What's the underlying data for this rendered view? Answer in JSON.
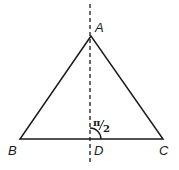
{
  "diagram": {
    "type": "isosceles-triangle-with-altitude",
    "points": {
      "A": {
        "label": "A",
        "x": 91,
        "y": 36
      },
      "B": {
        "label": "B",
        "x": 20,
        "y": 139
      },
      "C": {
        "label": "C",
        "x": 163,
        "y": 139
      },
      "D": {
        "label": "D",
        "x": 90,
        "y": 139
      }
    },
    "angle_label": {
      "num": "π",
      "den": "2",
      "at": "D"
    },
    "colors": {
      "stroke": "#1a1a1a",
      "background": "#ffffff"
    }
  }
}
